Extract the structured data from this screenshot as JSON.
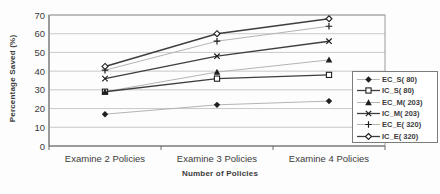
{
  "chart_data": {
    "type": "line",
    "title": "",
    "xlabel": "Number of Policies",
    "ylabel": "Percentage Saved (%)",
    "categories": [
      "Examine 2 Policies",
      "Examine 3 Policies",
      "Examine 4 Policies"
    ],
    "series": [
      {
        "name": "EC_S( 80)",
        "marker": "filled-diamond",
        "line_style": "light",
        "values": [
          17,
          22,
          24
        ]
      },
      {
        "name": "IC_S( 80)",
        "marker": "open-square",
        "line_style": "dark",
        "values": [
          29,
          36,
          38
        ]
      },
      {
        "name": "EC_M( 203)",
        "marker": "filled-triangle",
        "line_style": "light",
        "values": [
          29,
          39.5,
          46
        ]
      },
      {
        "name": "IC_M( 203)",
        "marker": "x",
        "line_style": "dark",
        "values": [
          36,
          48,
          56
        ]
      },
      {
        "name": "EC_E( 320)",
        "marker": "plus",
        "line_style": "light",
        "values": [
          40.5,
          56,
          64
        ]
      },
      {
        "name": "IC_E( 320)",
        "marker": "open-diamond",
        "line_style": "dark",
        "values": [
          42.5,
          60,
          68
        ]
      }
    ],
    "ylim": [
      0,
      70
    ],
    "yticks": [
      0,
      10,
      20,
      30,
      40,
      50,
      60,
      70
    ],
    "grid": true,
    "legend_position": "right-overlapping-plot",
    "colors": {
      "dark_line": "#3e3e3e",
      "light_line": "#b4b4b4",
      "marker": "#1f1f1f",
      "gridline": "#c9c9c9",
      "plot_border": "#9a9a9a",
      "axis": "#6b6b6b",
      "text": "#3b3b3b",
      "background": "#fdfdfd"
    }
  }
}
